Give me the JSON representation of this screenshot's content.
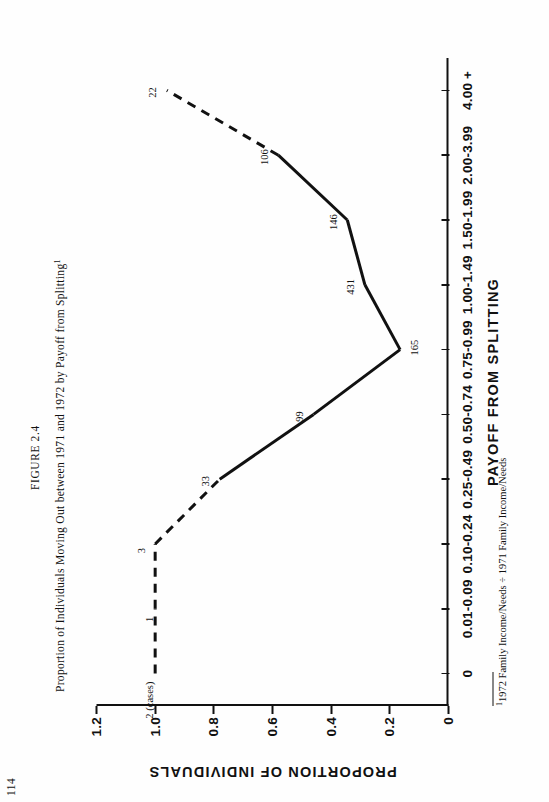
{
  "page": {
    "number": "114"
  },
  "figure": {
    "label": "FIGURE 2.4",
    "title": "Proportion of Individuals Moving Out between 1971 and 1972 by Payoff from Splitting",
    "title_footnote_marker": "1",
    "footnote_marker": "1",
    "footnote": "1972 Family Income/Needs ÷ 1971 Family Income/Needs"
  },
  "chart_data": {
    "type": "line",
    "title": "Proportion of Individuals Moving Out between 1971 and 1972 by Payoff from Splitting",
    "xlabel": "PAYOFF FROM SPLITTING",
    "ylabel": "PROPORTION OF INDIVIDUALS",
    "categories": [
      "0",
      "0.01-0.09",
      "0.10-0.24",
      "0.25-0.49",
      "0.50-0.74",
      "0.75-0.99",
      "1.00-1.49",
      "1.50-1.99",
      "2.00-3.99",
      "4.00 +"
    ],
    "values": [
      1.0,
      1.0,
      1.0,
      0.78,
      0.46,
      0.165,
      0.285,
      0.345,
      0.58,
      0.96
    ],
    "point_labels": [
      "2 (cases)",
      "1",
      "3",
      "33",
      "99",
      "165",
      "431",
      "146",
      "106",
      "22"
    ],
    "segment_styles": [
      "dashed",
      "dashed",
      "dashed",
      "solid",
      "solid",
      "solid",
      "solid",
      "solid",
      "dashed"
    ],
    "ylim": [
      0,
      1.2
    ],
    "yticks": [
      "0",
      "0.2",
      "0.4",
      "0.6",
      "0.8",
      "1.0",
      "1.2"
    ],
    "ytick_values": [
      0,
      0.2,
      0.4,
      0.6,
      0.8,
      1.0,
      1.2
    ],
    "grid": false,
    "legend": "none",
    "line_color": "#111111"
  }
}
